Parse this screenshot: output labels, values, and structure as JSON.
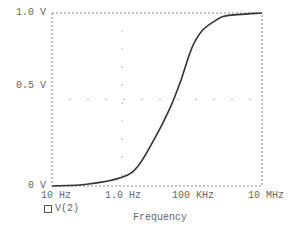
{
  "chart_data": {
    "type": "line",
    "title": "",
    "xlabel": "Frequency",
    "ylabel": "",
    "xscale": "log",
    "xlim_hz": [
      10,
      10000000
    ],
    "ylim": [
      0,
      1.0
    ],
    "x_tick_labels": [
      "10 Hz",
      "1.0 Hz",
      "100 KHz",
      "10 MHz"
    ],
    "y_tick_labels": [
      "0 V",
      "0.5 V",
      "1.0 V"
    ],
    "grid": "dotted",
    "legend": {
      "position": "bottom-left",
      "entries": [
        "V(2)"
      ]
    },
    "series": [
      {
        "name": "V(2)",
        "x_hz": [
          10,
          100,
          1000,
          3000,
          10000,
          20000,
          30000,
          50000,
          100000,
          200000,
          500000,
          1000000,
          10000000
        ],
        "values": [
          0.0,
          0.01,
          0.05,
          0.12,
          0.3,
          0.42,
          0.5,
          0.62,
          0.8,
          0.9,
          0.96,
          0.985,
          1.0
        ]
      }
    ],
    "caption": "(a)"
  },
  "labels": {
    "y_top": "1.0 V",
    "y_mid": "0.5 V",
    "y_bottom": "0 V",
    "x_0": "10 Hz",
    "x_1": "1.0 Hz",
    "x_2": "100 KHz",
    "x_3": "10 MHz",
    "x_axis_title": "Frequency",
    "legend_entry": "V(2)",
    "caption": "(a)"
  }
}
